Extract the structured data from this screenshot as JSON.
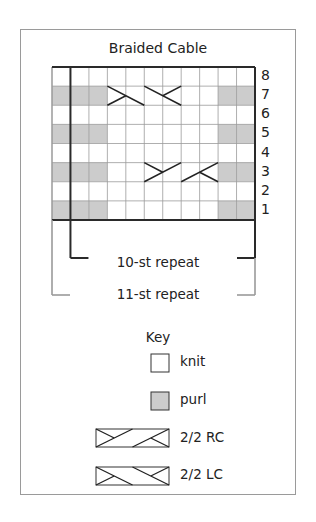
{
  "title": "Braided Cable",
  "chart_data": {
    "type": "table",
    "title": "Braided Cable",
    "columns": 11,
    "rows": 8,
    "row_numbers": [
      "8",
      "7",
      "6",
      "5",
      "4",
      "3",
      "2",
      "1"
    ],
    "legend": [
      "knit",
      "purl",
      "2/2 RC",
      "2/2 LC"
    ],
    "grid": [
      [
        "k",
        "k",
        "k",
        "k",
        "k",
        "k",
        "k",
        "k",
        "k",
        "k",
        "k"
      ],
      [
        "p",
        "p",
        "p",
        "LC",
        "LC",
        "LC",
        "LC",
        "k",
        "k",
        "p",
        "p"
      ],
      [
        "k",
        "k",
        "k",
        "k",
        "k",
        "k",
        "k",
        "k",
        "k",
        "k",
        "k"
      ],
      [
        "p",
        "p",
        "p",
        "k",
        "k",
        "k",
        "k",
        "k",
        "k",
        "p",
        "p"
      ],
      [
        "k",
        "k",
        "k",
        "k",
        "k",
        "k",
        "k",
        "k",
        "k",
        "k",
        "k"
      ],
      [
        "p",
        "p",
        "p",
        "k",
        "k",
        "RC",
        "RC",
        "RC",
        "RC",
        "p",
        "p"
      ],
      [
        "k",
        "k",
        "k",
        "k",
        "k",
        "k",
        "k",
        "k",
        "k",
        "k",
        "k"
      ],
      [
        "p",
        "p",
        "p",
        "k",
        "k",
        "k",
        "k",
        "k",
        "k",
        "p",
        "p"
      ]
    ],
    "cables": [
      {
        "row": 7,
        "type": "2/2 LC",
        "start_col": 4,
        "span": 4
      },
      {
        "row": 3,
        "type": "2/2 RC",
        "start_col": 6,
        "span": 4
      }
    ],
    "repeats": [
      {
        "label": "10-st repeat",
        "stitches": 10
      },
      {
        "label": "11-st repeat",
        "stitches": 11
      }
    ]
  },
  "rows": [
    "8",
    "7",
    "6",
    "5",
    "4",
    "3",
    "2",
    "1"
  ],
  "repeat_10": "10-st repeat",
  "repeat_11": "11-st repeat",
  "key": {
    "title": "Key",
    "items": [
      {
        "label": "knit"
      },
      {
        "label": "purl"
      },
      {
        "label": "2/2 RC"
      },
      {
        "label": "2/2 LC"
      }
    ]
  },
  "colors": {
    "purl": "#cccccc",
    "grid_line": "#9a9a9a",
    "border_dark": "#2a2a2a",
    "bracket_gray": "#9a9a9a"
  }
}
